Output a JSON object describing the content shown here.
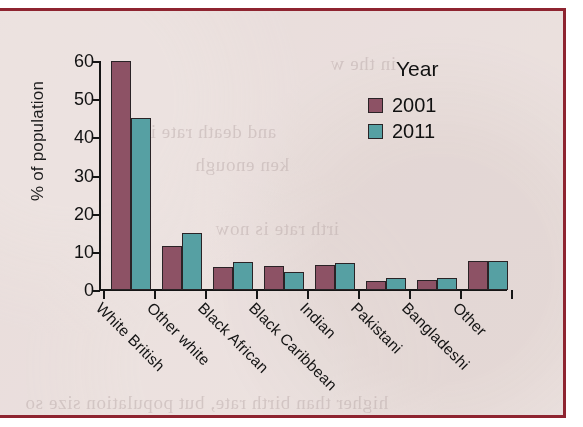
{
  "page": {
    "background_color": "#efe7e5",
    "border_color": "#8e2430",
    "bleed_through_lines": [
      "in the w",
      "and death rate in",
      "ken enough",
      "irth rate is now",
      "higher than birth rate, but population size so"
    ]
  },
  "chart_data": {
    "type": "bar",
    "title": "",
    "xlabel": "",
    "ylabel": "% of population",
    "ylim": [
      0,
      60
    ],
    "yticks": [
      0,
      10,
      20,
      30,
      40,
      50,
      60
    ],
    "ytick_labels": [
      "0",
      "10",
      "20",
      "30",
      "40",
      "50",
      "60"
    ],
    "grid": false,
    "legend_position": "upper-right",
    "legend_title": "Year",
    "categories": [
      "White British",
      "Other white",
      "Black African",
      "Black Caribbean",
      "Indian",
      "Pakistani",
      "Bangladeshi",
      "Other"
    ],
    "series": [
      {
        "name": "2001",
        "color": "#8d5265",
        "values": [
          60,
          11.5,
          6,
          6.2,
          6.5,
          2.4,
          2.6,
          7.5
        ]
      },
      {
        "name": "2011",
        "color": "#56a0a3",
        "values": [
          45,
          15,
          7.3,
          4.6,
          7,
          3.2,
          3.2,
          7.5
        ]
      }
    ]
  }
}
